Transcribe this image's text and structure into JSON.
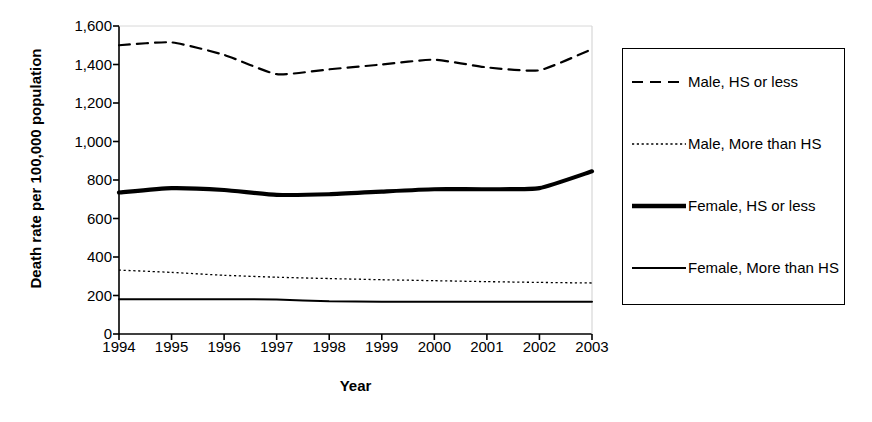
{
  "chart_data": {
    "type": "line",
    "title": "",
    "xlabel": "Year",
    "ylabel": "Death rate per 100,000 population",
    "x": [
      1994,
      1995,
      1996,
      1997,
      1998,
      1999,
      2000,
      2001,
      2002,
      2003
    ],
    "xticklabels": [
      "1994",
      "1995",
      "1996",
      "1997",
      "1998",
      "1999",
      "2000",
      "2001",
      "2002",
      "2003"
    ],
    "yticklabels": [
      "0",
      "200",
      "400",
      "600",
      "800",
      "1,000",
      "1,200",
      "1,400",
      "1,600"
    ],
    "yticks": [
      0,
      200,
      400,
      600,
      800,
      1000,
      1200,
      1400,
      1600
    ],
    "ylim": [
      0,
      1600
    ],
    "xlim": [
      1994,
      2003
    ],
    "grid": false,
    "legend_position": "right",
    "series": [
      {
        "name": "Male, HS or less",
        "style": "dashed",
        "width": 2.2,
        "color": "#000000",
        "values": [
          1500,
          1515,
          1450,
          1350,
          1375,
          1400,
          1425,
          1385,
          1370,
          1480
        ]
      },
      {
        "name": "Male, More than HS",
        "style": "dotted",
        "width": 1.3,
        "color": "#000000",
        "values": [
          332,
          320,
          305,
          295,
          288,
          282,
          277,
          272,
          268,
          265
        ]
      },
      {
        "name": "Female, HS or less",
        "style": "solid",
        "width": 4.2,
        "color": "#000000",
        "values": [
          735,
          758,
          748,
          723,
          726,
          740,
          752,
          752,
          758,
          845
        ]
      },
      {
        "name": "Female, More than HS",
        "style": "solid",
        "width": 2.0,
        "color": "#000000",
        "values": [
          181,
          181,
          181,
          179,
          170,
          168,
          167,
          167,
          167,
          167
        ]
      }
    ]
  },
  "legend": {
    "entries": [
      {
        "label": "Male, HS or less",
        "style": "dashed"
      },
      {
        "label": "Male, More than HS",
        "style": "dotted"
      },
      {
        "label": "Female, HS or less",
        "style": "thick-solid"
      },
      {
        "label": "Female, More than HS",
        "style": "solid"
      }
    ]
  },
  "axes": {
    "x_axis_title": "Year",
    "y_axis_title": "Death rate per 100,000 population"
  }
}
